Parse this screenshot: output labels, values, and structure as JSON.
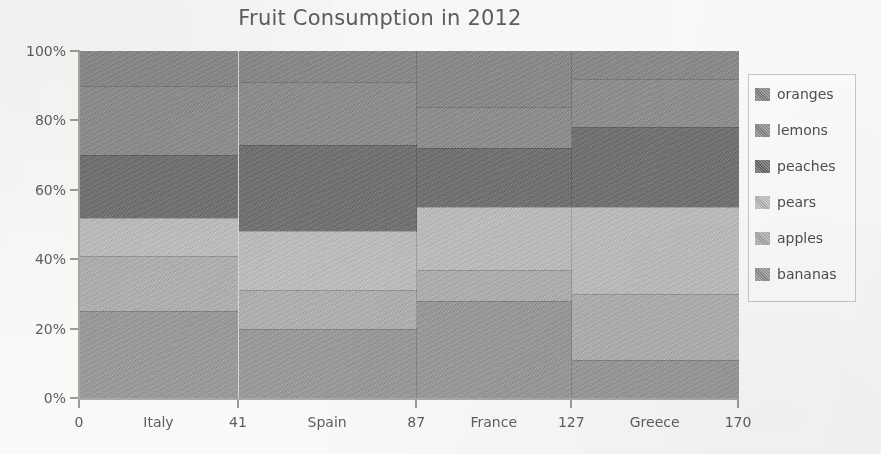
{
  "chart": {
    "title": "Fruit Consumption in 2012"
  },
  "legend": {
    "position": "right",
    "items": [
      {
        "label": "oranges",
        "color": "#8a8a8a"
      },
      {
        "label": "lemons",
        "color": "#8f8f8f"
      },
      {
        "label": "peaches",
        "color": "#6f6f6f"
      },
      {
        "label": "pears",
        "color": "#c3c3c3"
      },
      {
        "label": "apples",
        "color": "#b4b4b4"
      },
      {
        "label": "bananas",
        "color": "#9b9b9b"
      }
    ]
  },
  "y_axis": {
    "ticks": [
      "0%",
      "20%",
      "40%",
      "60%",
      "80%",
      "100%"
    ],
    "values": [
      0,
      20,
      40,
      60,
      80,
      100
    ]
  },
  "x_axis": {
    "boundaries": [
      "0",
      "41",
      "87",
      "127",
      "170"
    ],
    "boundary_values": [
      0,
      41,
      87,
      127,
      170
    ],
    "categories": [
      "Italy",
      "Spain",
      "France",
      "Greece"
    ]
  },
  "chart_data": {
    "type": "bar",
    "subtype": "marimekko-mosaic-100-percent-stacked",
    "title": "Fruit Consumption in 2012",
    "xlabel": "",
    "ylabel": "",
    "ylim": [
      0,
      100
    ],
    "y_tick_labels": [
      "0%",
      "20%",
      "40%",
      "60%",
      "80%",
      "100%"
    ],
    "grid": false,
    "legend_position": "right",
    "categories": [
      "Italy",
      "Spain",
      "France",
      "Greece"
    ],
    "column_boundaries": [
      0,
      41,
      87,
      127,
      170
    ],
    "column_widths": [
      41,
      46,
      40,
      43
    ],
    "series": [
      {
        "name": "oranges",
        "color": "#8a8a8a",
        "values": [
          10,
          9,
          16,
          8
        ]
      },
      {
        "name": "lemons",
        "color": "#8f8f8f",
        "values": [
          20,
          18,
          12,
          14
        ]
      },
      {
        "name": "peaches",
        "color": "#6f6f6f",
        "values": [
          18,
          25,
          17,
          23
        ]
      },
      {
        "name": "pears",
        "color": "#c3c3c3",
        "values": [
          11,
          17,
          18,
          25
        ]
      },
      {
        "name": "apples",
        "color": "#b4b4b4",
        "values": [
          16,
          11,
          9,
          19
        ]
      },
      {
        "name": "bananas",
        "color": "#9b9b9b",
        "values": [
          25,
          20,
          28,
          11
        ]
      }
    ],
    "cumulative_top_percent": {
      "Italy": [
        100,
        90,
        70,
        52,
        41,
        25
      ],
      "Spain": [
        100,
        91,
        73,
        48,
        31,
        20
      ],
      "France": [
        100,
        84,
        72,
        55,
        37,
        28
      ],
      "Greece": [
        100,
        92,
        78,
        55,
        30,
        11
      ]
    }
  }
}
